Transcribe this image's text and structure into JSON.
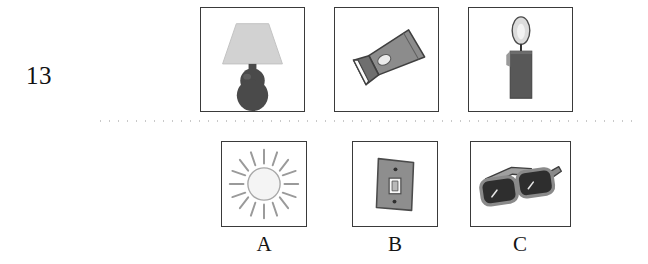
{
  "page": {
    "question_number": "13",
    "background_color": "#ffffff",
    "separator_color": "#c9c9c9"
  },
  "stem": {
    "items": [
      {
        "id": "lamp",
        "icon": "table-lamp-icon",
        "label": "table lamp"
      },
      {
        "id": "flashlight",
        "icon": "flashlight-icon",
        "label": "flashlight"
      },
      {
        "id": "candle",
        "icon": "lit-candle-icon",
        "label": "lit candle"
      }
    ]
  },
  "options": {
    "items": [
      {
        "letter": "A",
        "id": "sun",
        "icon": "sun-icon",
        "label": "sun"
      },
      {
        "letter": "B",
        "id": "light-switch",
        "icon": "light-switch-icon",
        "label": "light switch"
      },
      {
        "letter": "C",
        "id": "sunglasses",
        "icon": "sunglasses-icon",
        "label": "sunglasses"
      }
    ]
  },
  "colors": {
    "frame_border": "#3a3a3a",
    "dark_gray": "#4f4f4f",
    "mid_gray": "#8a8a8a",
    "light_gray": "#cfcfcf",
    "pale": "#f2f2f2",
    "ink": "#111111"
  }
}
